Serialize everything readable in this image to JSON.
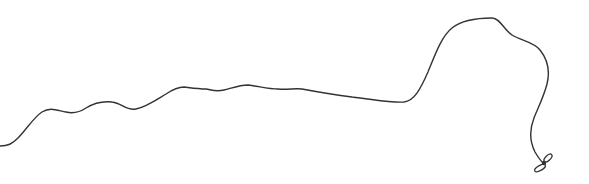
{
  "drawing": {
    "description": "Hand-drawn wavy line (cord) ending in a small knot",
    "stroke_color": "#333333",
    "background": "#ffffff",
    "path": "M0,146 C8,146 12,144 18,138 C26,130 34,117 42,112 C50,107 56,110 66,112 C74,114 80,112 86,108 C94,103 104,101 112,102 C122,103 126,111 136,109 C146,107 156,100 166,94 C172,90 178,87 184,87 C192,88 198,89 206,89 C212,90 216,92 224,90 C232,88 240,85 248,85 C258,86 268,89 278,89 C288,90 294,88 302,89 C318,92 336,95 352,97 C372,99 390,103 404,102 C414,101 420,90 428,72 C436,52 442,36 452,28 C462,20 478,18 492,18 C500,18 504,30 512,35 C522,41 534,42 540,50 C548,60 550,72 547,84 C544,96 538,108 534,118 C530,128 529,140 535,152 C538,157 540,160 543,163",
    "knot_loops": [
      {
        "cx": 548,
        "cy": 158,
        "rx": 5,
        "ry": 2.5,
        "rotate": -45
      },
      {
        "cx": 540,
        "cy": 168,
        "rx": 6,
        "ry": 2.5,
        "rotate": -30
      }
    ]
  }
}
